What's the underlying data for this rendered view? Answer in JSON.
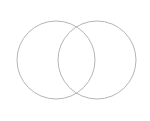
{
  "figure": {
    "name": "two-circle-venn-diagram",
    "type": "venn",
    "width": 150,
    "height": 121,
    "background_color": "#ffffff",
    "has_labels": false,
    "has_title": false,
    "has_legend": false,
    "set_count": 2
  },
  "style": {
    "stroke_color": "#b5b5b5",
    "stroke_width": 1,
    "fill": "none",
    "fill_opacity": 0
  },
  "chart_data": {
    "type": "venn",
    "title": "",
    "xlabel": "",
    "ylabel": "",
    "grid": false,
    "legend": "none",
    "sets": [
      {
        "id": "set-a",
        "label": "",
        "cx": 56,
        "cy": 60,
        "r": 39,
        "stroke": "#b5b5b5",
        "fill": "none"
      },
      {
        "id": "set-b",
        "label": "",
        "cx": 97,
        "cy": 60,
        "r": 39,
        "stroke": "#b5b5b5",
        "fill": "none"
      }
    ],
    "intersection_points": [
      {
        "x": 78,
        "y": 27
      },
      {
        "x": 78,
        "y": 93
      }
    ],
    "regions": [
      {
        "id": "a-only",
        "label": "",
        "value": null
      },
      {
        "id": "a-and-b",
        "label": "",
        "value": null
      },
      {
        "id": "b-only",
        "label": "",
        "value": null
      }
    ],
    "extents": {
      "left": 17,
      "right": 136,
      "top": 21,
      "bottom": 99
    }
  }
}
